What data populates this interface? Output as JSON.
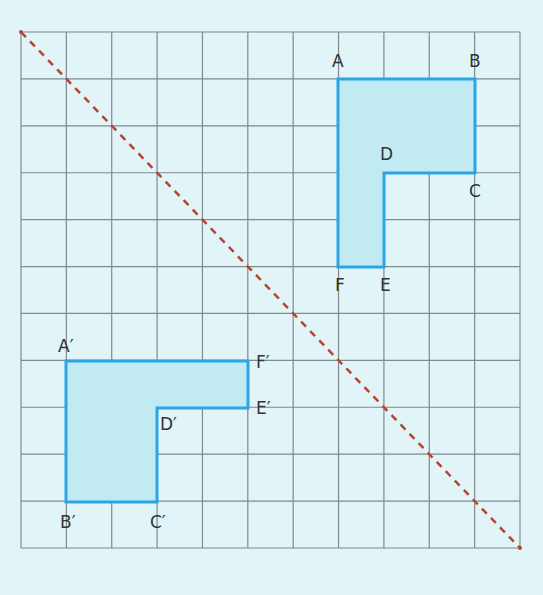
{
  "diagram": {
    "type": "reflection-on-grid",
    "grid": {
      "cols": 11,
      "rows": 11,
      "x0": 21,
      "y0": 32,
      "x1": 520,
      "y1": 548
    },
    "colors": {
      "background": "#e1f5f9",
      "grid": "#7d8a90",
      "shape_stroke": "#2aa6e8",
      "shape_fill": "#c2eaf3",
      "mirror_line": "#b5452e",
      "label": "#333333"
    },
    "mirror_line": {
      "from": [
        0,
        0
      ],
      "to": [
        11,
        11
      ],
      "style": "dashed"
    },
    "shapes": [
      {
        "name": "original",
        "vertices": [
          {
            "label": "A",
            "pos": [
              7,
              1
            ]
          },
          {
            "label": "B",
            "pos": [
              10,
              1
            ]
          },
          {
            "label": "C",
            "pos": [
              10,
              3
            ]
          },
          {
            "label": "D",
            "pos": [
              8,
              3
            ]
          },
          {
            "label": "E",
            "pos": [
              8,
              5
            ]
          },
          {
            "label": "F",
            "pos": [
              7,
              5
            ]
          }
        ]
      },
      {
        "name": "image",
        "vertices": [
          {
            "label": "A′",
            "pos": [
              1,
              7
            ]
          },
          {
            "label": "B′",
            "pos": [
              1,
              10
            ]
          },
          {
            "label": "C′",
            "pos": [
              3,
              10
            ]
          },
          {
            "label": "D′",
            "pos": [
              3,
              8
            ]
          },
          {
            "label": "E′",
            "pos": [
              5,
              8
            ]
          },
          {
            "label": "F′",
            "pos": [
              5,
              7
            ]
          }
        ]
      }
    ]
  },
  "labels": {
    "A": "A",
    "B": "B",
    "C": "C",
    "D": "D",
    "E": "E",
    "F": "F",
    "A_prime": "A′",
    "B_prime": "B′",
    "C_prime": "C′",
    "D_prime": "D′",
    "E_prime": "E′",
    "F_prime": "F′"
  }
}
